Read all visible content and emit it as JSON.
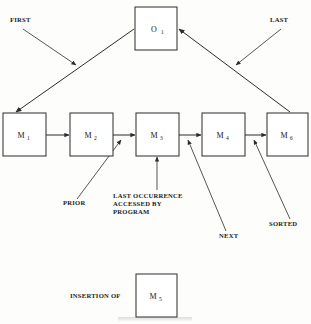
{
  "diagram": {
    "background_color": "#fdfdfb",
    "line_color": "#2b2b2b",
    "nodes": [
      {
        "id": "O1",
        "base": "O",
        "sub": "1",
        "x": 135,
        "y": 7,
        "w": 42,
        "h": 43
      },
      {
        "id": "M1",
        "base": "M",
        "sub": "1",
        "x": 3,
        "y": 113,
        "w": 43,
        "h": 43
      },
      {
        "id": "M2",
        "base": "M",
        "sub": "2",
        "x": 70,
        "y": 113,
        "w": 43,
        "h": 43
      },
      {
        "id": "M3",
        "base": "M",
        "sub": "3",
        "x": 136,
        "y": 113,
        "w": 43,
        "h": 43
      },
      {
        "id": "M4",
        "base": "M",
        "sub": "4",
        "x": 202,
        "y": 113,
        "w": 43,
        "h": 43
      },
      {
        "id": "M6",
        "base": "M",
        "sub": "6",
        "x": 267,
        "y": 113,
        "w": 41,
        "h": 43
      },
      {
        "id": "M5",
        "base": "M",
        "sub": "5",
        "x": 136,
        "y": 274,
        "w": 41,
        "h": 43
      }
    ],
    "callouts": [
      {
        "id": "first",
        "lines": [
          "FIRST"
        ],
        "x": 10,
        "y": 22,
        "anchor": "start"
      },
      {
        "id": "last",
        "lines": [
          "LAST"
        ],
        "x": 270,
        "y": 22,
        "anchor": "start"
      },
      {
        "id": "prior",
        "lines": [
          "PRIOR"
        ],
        "x": 63,
        "y": 205,
        "anchor": "start"
      },
      {
        "id": "last-occurrence",
        "lines": [
          "LAST OCCURRENCE",
          "ACCESSED BY",
          "PROGRAM"
        ],
        "x": 113,
        "y": 198,
        "anchor": "start"
      },
      {
        "id": "next",
        "lines": [
          "NEXT"
        ],
        "x": 219,
        "y": 238,
        "anchor": "start"
      },
      {
        "id": "sorted",
        "lines": [
          "SORTED"
        ],
        "x": 269,
        "y": 226,
        "anchor": "start"
      },
      {
        "id": "insertion-of",
        "lines": [
          "INSERTION OF"
        ],
        "x": 70,
        "y": 298,
        "anchor": "start"
      }
    ],
    "chain_order": [
      "M1",
      "M2",
      "M3",
      "M4",
      "M6"
    ],
    "pointers": [
      {
        "from": "FIRST",
        "to": "head-link"
      },
      {
        "from": "LAST",
        "to": "tail-link"
      },
      {
        "from": "PRIOR",
        "to": "M2-M3-link"
      },
      {
        "from": "LAST OCCURRENCE ACCESSED BY PROGRAM",
        "to": "M3"
      },
      {
        "from": "NEXT",
        "to": "M3-M4-link"
      },
      {
        "from": "SORTED",
        "to": "M4-M6-link"
      },
      {
        "from": "O1",
        "to": "M1"
      },
      {
        "from": "M6",
        "to": "O1"
      }
    ]
  }
}
